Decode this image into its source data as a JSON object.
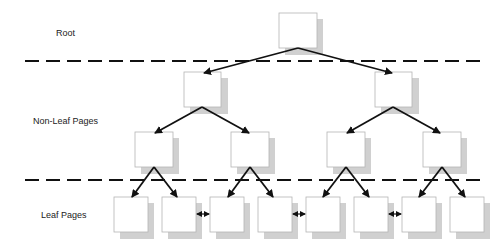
{
  "diagram": {
    "levels": [
      {
        "label": "Root",
        "x": 56,
        "y": 28
      },
      {
        "label": "Non-Leaf Pages",
        "x": 33,
        "y": 116
      },
      {
        "label": "Leaf Pages",
        "x": 41,
        "y": 210
      }
    ],
    "colors": {
      "box_border": "#b5b5b5",
      "box_fill": "#ffffff",
      "shadow": "#d0d0d0",
      "line": "#111111"
    }
  }
}
